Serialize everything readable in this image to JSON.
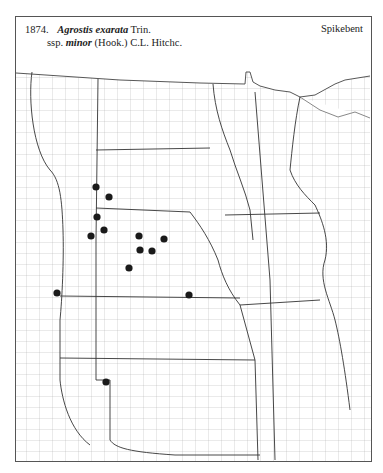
{
  "header": {
    "number": "1874.",
    "genus_species": "Agrostis exarata",
    "author": "Trin.",
    "rank": "ssp.",
    "infraspecific": "minor",
    "infra_author": "(Hook.) C.L. Hitchc.",
    "common_name": "Spikebent"
  },
  "map": {
    "region": "Great Plains, USA (county outline map)",
    "marker_color": "#1a1a1a",
    "line_color": "#777777",
    "state_line_color": "#333333",
    "occurrences": [
      {
        "x": 96,
        "y": 187
      },
      {
        "x": 109,
        "y": 197
      },
      {
        "x": 97,
        "y": 217
      },
      {
        "x": 104,
        "y": 230
      },
      {
        "x": 91,
        "y": 236
      },
      {
        "x": 139,
        "y": 236
      },
      {
        "x": 164,
        "y": 239
      },
      {
        "x": 140,
        "y": 250
      },
      {
        "x": 152,
        "y": 251
      },
      {
        "x": 129,
        "y": 268
      },
      {
        "x": 57,
        "y": 293
      },
      {
        "x": 189,
        "y": 295
      },
      {
        "x": 106,
        "y": 382
      }
    ]
  }
}
